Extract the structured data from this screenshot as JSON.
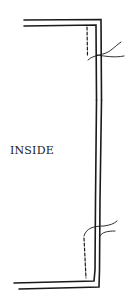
{
  "diagram": {
    "label": "INSIDE",
    "line_color": "#1a1a1a",
    "background": "#ffffff"
  }
}
